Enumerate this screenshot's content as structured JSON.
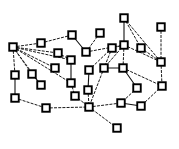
{
  "figure": {
    "title": "",
    "width": 179,
    "height": 149,
    "background_color": "#ffffff",
    "node_fill_color": "#ffffff",
    "node_stroke_color": "#000000",
    "edge_color": "#1a1a1a",
    "node_shape": "square",
    "node_size": 7.5,
    "node_count": 31,
    "edge_count": 43
  },
  "chart_data": {
    "type": "scatter",
    "title": "",
    "xlabel": "",
    "ylabel": "",
    "grid": false,
    "legend": "none",
    "xlim": [
      0,
      179
    ],
    "ylim": [
      0,
      149
    ],
    "nodes": [
      {
        "id": "n0",
        "x": 13,
        "y": 47
      },
      {
        "id": "n1",
        "x": 41,
        "y": 43
      },
      {
        "id": "n2",
        "x": 72,
        "y": 35
      },
      {
        "id": "n3",
        "x": 86,
        "y": 52
      },
      {
        "id": "n4",
        "x": 100,
        "y": 33
      },
      {
        "id": "n5",
        "x": 124,
        "y": 18
      },
      {
        "id": "n6",
        "x": 124,
        "y": 45
      },
      {
        "id": "n7",
        "x": 141,
        "y": 48
      },
      {
        "id": "n8",
        "x": 161,
        "y": 27
      },
      {
        "id": "n9",
        "x": 161,
        "y": 62
      },
      {
        "id": "n10",
        "x": 15,
        "y": 75
      },
      {
        "id": "n11",
        "x": 32,
        "y": 74
      },
      {
        "id": "n12",
        "x": 41,
        "y": 85
      },
      {
        "id": "n13",
        "x": 15,
        "y": 98
      },
      {
        "id": "n14",
        "x": 46,
        "y": 108
      },
      {
        "id": "n15",
        "x": 58,
        "y": 53
      },
      {
        "id": "n16",
        "x": 71,
        "y": 60
      },
      {
        "id": "n17",
        "x": 71,
        "y": 83
      },
      {
        "id": "n18",
        "x": 89,
        "y": 70
      },
      {
        "id": "n19",
        "x": 88,
        "y": 90
      },
      {
        "id": "n20",
        "x": 75,
        "y": 96
      },
      {
        "id": "n21",
        "x": 104,
        "y": 68
      },
      {
        "id": "n22",
        "x": 123,
        "y": 68
      },
      {
        "id": "n23",
        "x": 112,
        "y": 48
      },
      {
        "id": "n24",
        "x": 137,
        "y": 88
      },
      {
        "id": "n25",
        "x": 162,
        "y": 86
      },
      {
        "id": "n26",
        "x": 89,
        "y": 107
      },
      {
        "id": "n27",
        "x": 121,
        "y": 103
      },
      {
        "id": "n28",
        "x": 141,
        "y": 106
      },
      {
        "id": "n29",
        "x": 117,
        "y": 128
      },
      {
        "id": "n30",
        "x": 55,
        "y": 68
      }
    ],
    "edges": [
      {
        "source": "n0",
        "target": "n1",
        "style": "dashed"
      },
      {
        "source": "n0",
        "target": "n10",
        "style": "dashed"
      },
      {
        "source": "n0",
        "target": "n11",
        "style": "dashed"
      },
      {
        "source": "n0",
        "target": "n12",
        "style": "dashed"
      },
      {
        "source": "n0",
        "target": "n15",
        "style": "dashed"
      },
      {
        "source": "n0",
        "target": "n16",
        "style": "dashed"
      },
      {
        "source": "n0",
        "target": "n17",
        "style": "dashed"
      },
      {
        "source": "n0",
        "target": "n30",
        "style": "dashed"
      },
      {
        "source": "n1",
        "target": "n2",
        "style": "dashed"
      },
      {
        "source": "n2",
        "target": "n3",
        "style": "solid"
      },
      {
        "source": "n3",
        "target": "n4",
        "style": "dashed"
      },
      {
        "source": "n3",
        "target": "n6",
        "style": "dashed"
      },
      {
        "source": "n5",
        "target": "n6",
        "style": "solid"
      },
      {
        "source": "n5",
        "target": "n7",
        "style": "dashed"
      },
      {
        "source": "n5",
        "target": "n9",
        "style": "dashed"
      },
      {
        "source": "n6",
        "target": "n23",
        "style": "dashed"
      },
      {
        "source": "n6",
        "target": "n21",
        "style": "dashed"
      },
      {
        "source": "n6",
        "target": "n22",
        "style": "dashed"
      },
      {
        "source": "n6",
        "target": "n9",
        "style": "dashed"
      },
      {
        "source": "n7",
        "target": "n9",
        "style": "dashed"
      },
      {
        "source": "n8",
        "target": "n9",
        "style": "dashed"
      },
      {
        "source": "n9",
        "target": "n25",
        "style": "dashed"
      },
      {
        "source": "n10",
        "target": "n13",
        "style": "solid"
      },
      {
        "source": "n11",
        "target": "n12",
        "style": "solid"
      },
      {
        "source": "n13",
        "target": "n14",
        "style": "dashed"
      },
      {
        "source": "n14",
        "target": "n26",
        "style": "dashed"
      },
      {
        "source": "n15",
        "target": "n16",
        "style": "dashed"
      },
      {
        "source": "n16",
        "target": "n17",
        "style": "solid"
      },
      {
        "source": "n17",
        "target": "n20",
        "style": "dashed"
      },
      {
        "source": "n18",
        "target": "n19",
        "style": "solid"
      },
      {
        "source": "n18",
        "target": "n23",
        "style": "dashed"
      },
      {
        "source": "n19",
        "target": "n26",
        "style": "dashed"
      },
      {
        "source": "n20",
        "target": "n26",
        "style": "dashed"
      },
      {
        "source": "n21",
        "target": "n22",
        "style": "solid"
      },
      {
        "source": "n21",
        "target": "n26",
        "style": "dashed"
      },
      {
        "source": "n22",
        "target": "n24",
        "style": "solid"
      },
      {
        "source": "n22",
        "target": "n25",
        "style": "dashed"
      },
      {
        "source": "n23",
        "target": "n21",
        "style": "dashed"
      },
      {
        "source": "n24",
        "target": "n27",
        "style": "dashed"
      },
      {
        "source": "n25",
        "target": "n28",
        "style": "dashed"
      },
      {
        "source": "n26",
        "target": "n27",
        "style": "dashed"
      },
      {
        "source": "n26",
        "target": "n29",
        "style": "dashed"
      },
      {
        "source": "n27",
        "target": "n28",
        "style": "solid"
      }
    ]
  }
}
